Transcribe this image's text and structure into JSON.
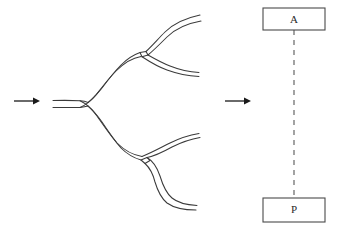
{
  "figure": {
    "type": "diagram",
    "canvas": {
      "width": 339,
      "height": 231,
      "background": "#ffffff"
    },
    "colors": {
      "tube_stroke": "#3a3a3a",
      "arrow": "#1a1a1a",
      "box_stroke": "#4a4a4a",
      "box_fill": "#ffffff",
      "dashed_link": "#8c8c8c",
      "label_text": "#2a2a2a"
    },
    "arrows": [
      {
        "id": "inflow-arrow",
        "x1": 14,
        "y1": 101,
        "x2": 40,
        "y2": 101,
        "direction": "right"
      },
      {
        "id": "transform-arrow",
        "x1": 225,
        "y1": 101,
        "x2": 251,
        "y2": 101,
        "direction": "right"
      }
    ],
    "tube_tree": {
      "trunk": {
        "start_x": 53,
        "start_y": 104,
        "junction_x": 86,
        "junction_y": 104
      },
      "branches": [
        {
          "id": "upper-branch",
          "direction": "up"
        },
        {
          "id": "lower-branch",
          "direction": "down"
        }
      ],
      "terminals": 4,
      "bifurcations": 3
    },
    "graph": {
      "nodes": [
        {
          "id": "node-a",
          "label": "A",
          "x": 263,
          "y": 8,
          "width": 62,
          "height": 22,
          "cx": 294,
          "cy": 19
        },
        {
          "id": "node-p",
          "label": "P",
          "x": 263,
          "y": 198,
          "width": 62,
          "height": 24,
          "cx": 294,
          "cy": 210
        }
      ],
      "edges": [
        {
          "id": "edge-a-p",
          "from": "A",
          "to": "P",
          "style": "dashed",
          "x": 294,
          "y1": 30,
          "y2": 198
        }
      ]
    }
  }
}
